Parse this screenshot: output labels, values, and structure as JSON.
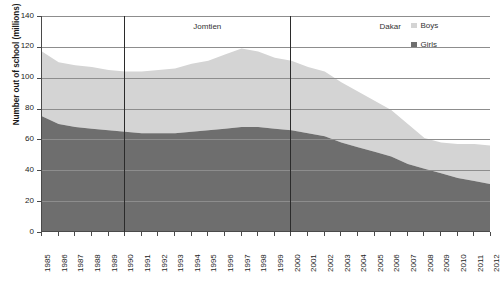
{
  "chart_data": {
    "type": "area",
    "stacked": true,
    "title": "",
    "xlabel": "",
    "ylabel": "Number out of school (millions)",
    "ylim": [
      0,
      140
    ],
    "ytick_step": 20,
    "yticks": [
      0,
      20,
      40,
      60,
      80,
      100,
      120,
      140
    ],
    "grid": true,
    "grid_axis": "y",
    "legend_position": "top-right",
    "x": [
      1985,
      1986,
      1987,
      1988,
      1989,
      1990,
      1991,
      1992,
      1993,
      1994,
      1995,
      1996,
      1997,
      1998,
      1999,
      2000,
      2001,
      2002,
      2003,
      2004,
      2005,
      2006,
      2007,
      2008,
      2009,
      2010,
      2011,
      2012
    ],
    "categories": [
      "1985",
      "1986",
      "1987",
      "1988",
      "1989",
      "1990",
      "1991",
      "1992",
      "1993",
      "1994",
      "1995",
      "1996",
      "1997",
      "1998",
      "1999",
      "2000",
      "2001",
      "2002",
      "2003",
      "2004",
      "2005",
      "2006",
      "2007",
      "2008",
      "2009",
      "2010",
      "2011",
      "2012"
    ],
    "series": [
      {
        "name": "Girls",
        "color": "#6e6e6e",
        "values": [
          75,
          70,
          68,
          67,
          66,
          65,
          64,
          64,
          64,
          65,
          66,
          67,
          68,
          68,
          67,
          66,
          64,
          62,
          58,
          55,
          52,
          49,
          44,
          41,
          38,
          35,
          33,
          31
        ]
      },
      {
        "name": "Boys",
        "color": "#d4d4d4",
        "values": [
          42,
          40,
          40,
          40,
          39,
          39,
          40,
          41,
          42,
          44,
          45,
          48,
          51,
          49,
          46,
          45,
          43,
          42,
          39,
          36,
          33,
          30,
          26,
          20,
          20,
          22,
          24,
          25
        ]
      }
    ],
    "totals": [
      117,
      110,
      108,
      107,
      105,
      104,
      104,
      105,
      106,
      109,
      111,
      115,
      119,
      117,
      113,
      111,
      107,
      104,
      97,
      91,
      85,
      79,
      70,
      61,
      58,
      57,
      57,
      56
    ],
    "annotations": [
      {
        "type": "vline",
        "x": 1990,
        "label": "Jomtien",
        "label_span": [
          1990,
          2000
        ]
      },
      {
        "type": "vline",
        "x": 2000,
        "label": "Dakar",
        "label_span": [
          2000,
          2012
        ]
      }
    ]
  },
  "legend": {
    "items": [
      {
        "label": "Boys",
        "color": "#d4d4d4",
        "swatch_name": "legend-swatch-boys"
      },
      {
        "label": "Girls",
        "color": "#6e6e6e",
        "swatch_name": "legend-swatch-girls"
      }
    ]
  },
  "axis": {
    "y_title": "Number out of school (millions)",
    "y_labels": [
      "140",
      "120",
      "100",
      "80",
      "60",
      "40",
      "20",
      "0"
    ],
    "x_labels": [
      "1985",
      "1986",
      "1987",
      "1988",
      "1989",
      "1990",
      "1991",
      "1992",
      "1993",
      "1994",
      "1995",
      "1996",
      "1997",
      "1998",
      "1999",
      "2000",
      "2001",
      "2002",
      "2003",
      "2004",
      "2005",
      "2006",
      "2007",
      "2008",
      "2009",
      "2010",
      "2011",
      "2012"
    ]
  },
  "eras": [
    {
      "name": "era-jomtien",
      "label": "Jomtien"
    },
    {
      "name": "era-dakar",
      "label": "Dakar"
    }
  ],
  "caption": {
    "text": ""
  }
}
